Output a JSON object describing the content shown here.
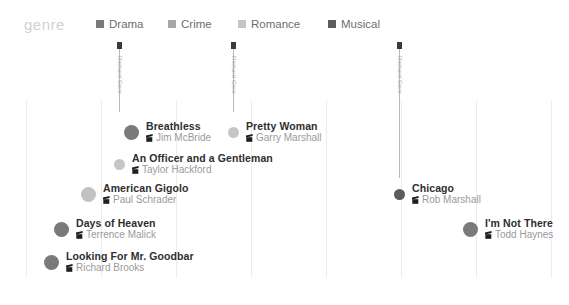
{
  "legend": {
    "title": "genre",
    "items": [
      {
        "label": "Drama",
        "color": "#7a7a7a",
        "x": 96
      },
      {
        "label": "Crime",
        "color": "#a8a8a8",
        "x": 168
      },
      {
        "label": "Romance",
        "color": "#c6c6c6",
        "x": 238
      },
      {
        "label": "Musical",
        "color": "#5c5c5c",
        "x": 328
      }
    ]
  },
  "axis": {
    "ticks": [
      "1975",
      "1980",
      "1985",
      "1990",
      "1995",
      "2000",
      "2005",
      "2010"
    ],
    "tick_x": [
      26,
      101,
      176,
      251,
      326,
      401,
      476,
      551
    ],
    "min_year": 1975,
    "max_year": 2010
  },
  "gridlines_x": [
    26,
    101,
    176,
    251,
    326,
    401,
    476,
    551
  ],
  "stems": [
    {
      "label": "Richard Gere",
      "x": 119,
      "top": 6,
      "height": 66
    },
    {
      "label": "Richard Gere",
      "x": 233,
      "top": 6,
      "height": 66
    },
    {
      "label": "Richard Gere",
      "x": 399,
      "top": 6,
      "height": 132
    }
  ],
  "chart_data": {
    "type": "scatter",
    "title": "genre",
    "xlabel": "",
    "ylabel": "",
    "xlim": [
      1975,
      2010
    ],
    "grid": true,
    "legend_position": "top",
    "categories": [
      "Drama",
      "Crime",
      "Romance",
      "Musical"
    ],
    "points": [
      {
        "title": "Breathless",
        "director": "Jim McBride",
        "year": 1983,
        "genre": "Drama",
        "color": "#7a7a7a",
        "x": 131,
        "y": 80,
        "size": "large"
      },
      {
        "title": "Pretty Woman",
        "director": "Garry Marshall",
        "year": 1990,
        "genre": "Romance",
        "color": "#c6c6c6",
        "x": 233,
        "y": 80,
        "size": "small"
      },
      {
        "title": "An Officer and a Gentleman",
        "director": "Taylor Hackford",
        "year": 1982,
        "genre": "Romance",
        "color": "#c6c6c6",
        "x": 119,
        "y": 112,
        "size": "small"
      },
      {
        "title": "American Gigolo",
        "director": "Paul Schrader",
        "year": 1980,
        "genre": "Crime",
        "color": "#c2c2c2",
        "x": 88,
        "y": 142,
        "size": "large"
      },
      {
        "title": "Chicago",
        "director": "Rob Marshall",
        "year": 2002,
        "genre": "Musical",
        "color": "#5c5c5c",
        "x": 399,
        "y": 142,
        "size": "small"
      },
      {
        "title": "Days of Heaven",
        "director": "Terrence Malick",
        "year": 1978,
        "genre": "Drama",
        "color": "#7a7a7a",
        "x": 61,
        "y": 177,
        "size": "large"
      },
      {
        "title": "I'm Not There",
        "director": "Todd Haynes",
        "year": 2007,
        "genre": "Drama",
        "color": "#7a7a7a",
        "x": 470,
        "y": 177,
        "size": "large"
      },
      {
        "title": "Looking For Mr. Goodbar",
        "director": "Richard Brooks",
        "year": 1977,
        "genre": "Drama",
        "color": "#7a7a7a",
        "x": 51,
        "y": 210,
        "size": "large"
      }
    ]
  }
}
